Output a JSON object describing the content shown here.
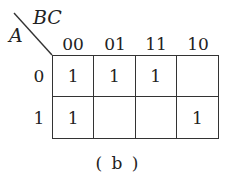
{
  "kmap": {
    "row_var": "A",
    "col_var": "BC",
    "col_labels": [
      "00",
      "01",
      "11",
      "10"
    ],
    "row_labels": [
      "0",
      "1"
    ],
    "cells": [
      [
        "1",
        "1",
        "1",
        ""
      ],
      [
        "1",
        "",
        "",
        "1"
      ]
    ]
  },
  "caption": "( b )"
}
